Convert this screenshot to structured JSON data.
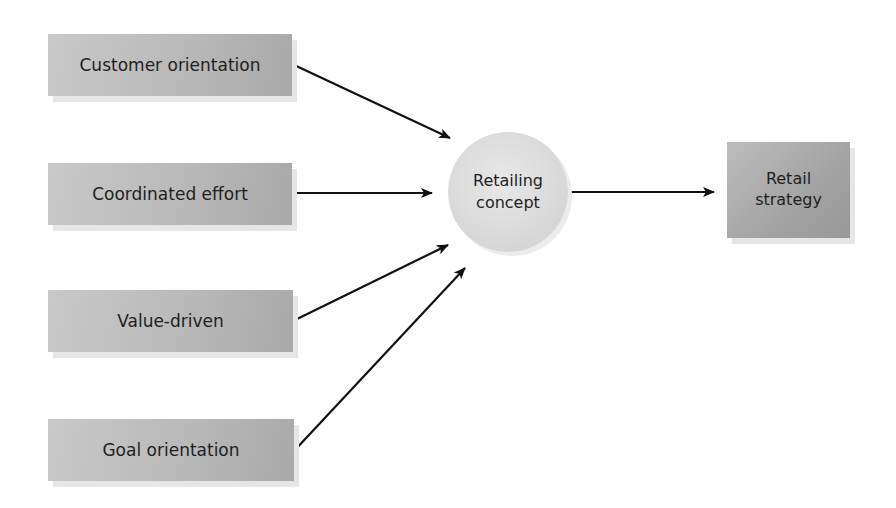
{
  "diagram": {
    "inputs": [
      {
        "label": "Customer orientation"
      },
      {
        "label": "Coordinated effort"
      },
      {
        "label": "Value-driven"
      },
      {
        "label": "Goal orientation"
      }
    ],
    "center": {
      "line1": "Retailing",
      "line2": "concept"
    },
    "output": {
      "line1": "Retail",
      "line2": "strategy"
    },
    "edges": [
      {
        "from": "Customer orientation",
        "to": "Retailing concept"
      },
      {
        "from": "Coordinated effort",
        "to": "Retailing concept"
      },
      {
        "from": "Value-driven",
        "to": "Retailing concept"
      },
      {
        "from": "Goal orientation",
        "to": "Retailing concept"
      },
      {
        "from": "Retailing concept",
        "to": "Retail strategy"
      }
    ]
  }
}
